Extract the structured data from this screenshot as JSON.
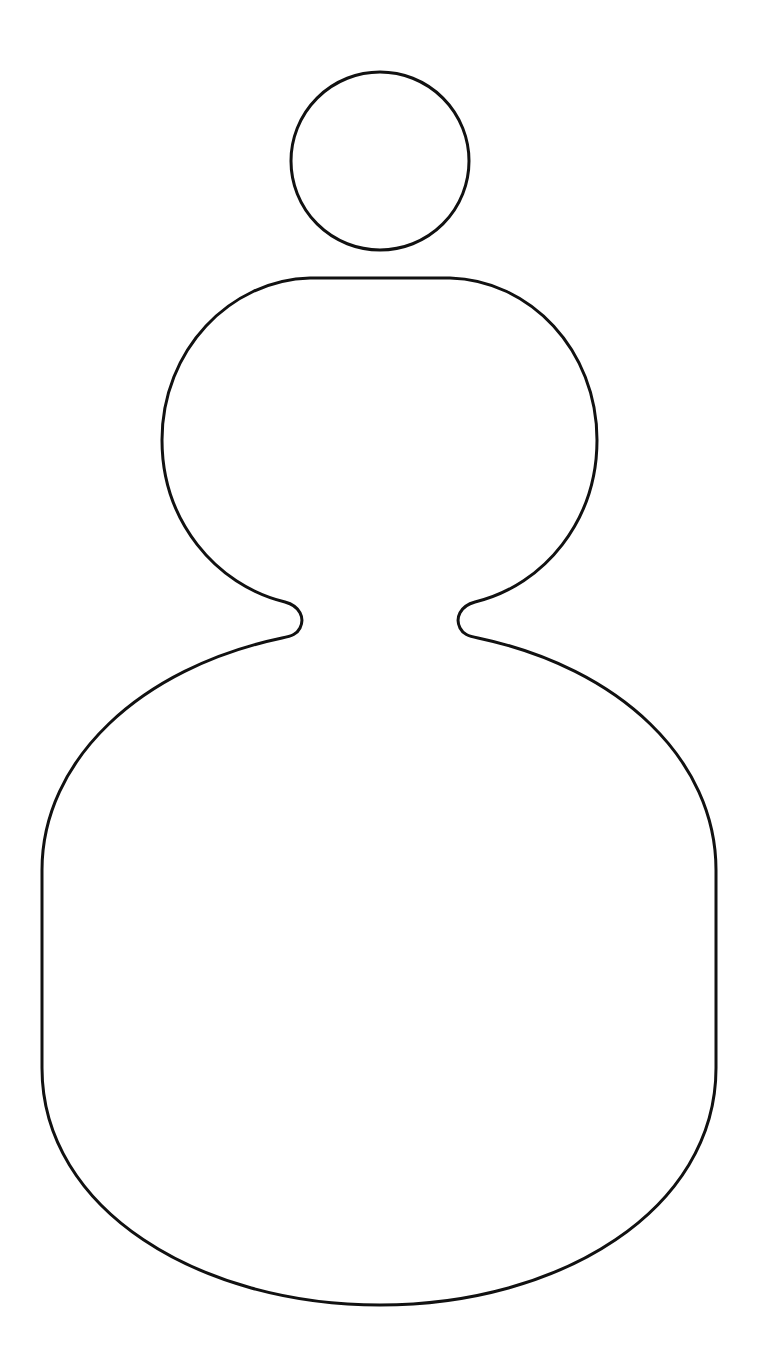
{
  "figure": {
    "background_color": "#ffffff",
    "stroke_color": "#111111",
    "stroke_width": 3,
    "fill_color": "#ffffff",
    "head_circle": {
      "cx": 380,
      "cy": 161,
      "r": 89
    },
    "body_path": "M 310 278 L 450 278 C 530 280 597 350 597 440 C 597 520 545 585 475 602 C 460 606 455 618 460 628 C 463 634 468 636 478 638 C 620 668 716 760 716 870 L 716 1068 C 716 1210 560 1305 380 1305 C 200 1305 42 1210 42 1068 L 42 870 C 42 760 140 668 282 638 C 292 636 297 634 300 628 C 305 618 300 606 285 602 C 215 585 162 520 162 440 C 162 350 230 280 310 278 Z"
  }
}
